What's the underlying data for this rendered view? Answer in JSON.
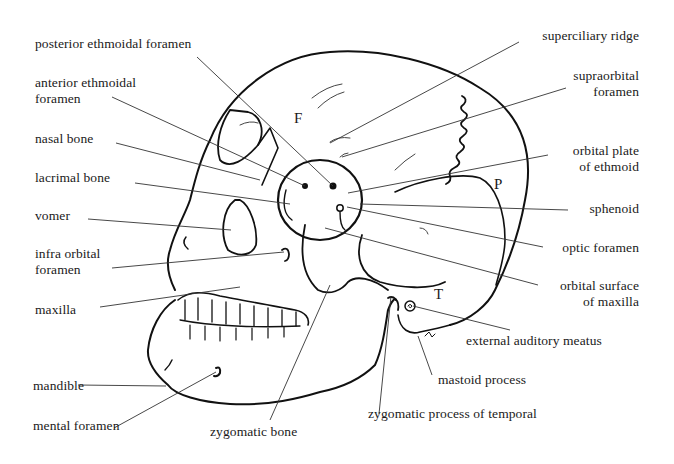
{
  "diagram": {
    "bone_letters": [
      {
        "id": "F",
        "text": "F",
        "meaning": "frontal"
      },
      {
        "id": "P",
        "text": "P",
        "meaning": "parietal"
      },
      {
        "id": "T",
        "text": "T",
        "meaning": "temporal"
      }
    ],
    "labels_left": [
      {
        "line1": "posterior ethmoidal foramen",
        "line2": ""
      },
      {
        "line1": "anterior ethmoidal",
        "line2": "foramen"
      },
      {
        "line1": "nasal bone",
        "line2": ""
      },
      {
        "line1": "lacrimal bone",
        "line2": ""
      },
      {
        "line1": "vomer",
        "line2": ""
      },
      {
        "line1": "infra orbital",
        "line2": "foramen"
      },
      {
        "line1": "maxilla",
        "line2": ""
      },
      {
        "line1": "mandible",
        "line2": ""
      },
      {
        "line1": "mental foramen",
        "line2": ""
      }
    ],
    "labels_right": [
      {
        "line1": "superciliary ridge",
        "line2": ""
      },
      {
        "line1": "supraorbital",
        "line2": "foramen"
      },
      {
        "line1": "orbital plate",
        "line2": "of ethmoid"
      },
      {
        "line1": "sphenoid",
        "line2": ""
      },
      {
        "line1": "optic foramen",
        "line2": ""
      },
      {
        "line1": "orbital surface",
        "line2": "of maxilla"
      },
      {
        "line1": "external auditory meatus",
        "line2": ""
      },
      {
        "line1": "mastoid process",
        "line2": ""
      }
    ],
    "labels_bottom": [
      {
        "line1": "zygomatic bone"
      },
      {
        "line1": "zygomatic process of temporal"
      }
    ],
    "colors": {
      "ink": "#1a1a1a",
      "background": "#ffffff"
    }
  }
}
